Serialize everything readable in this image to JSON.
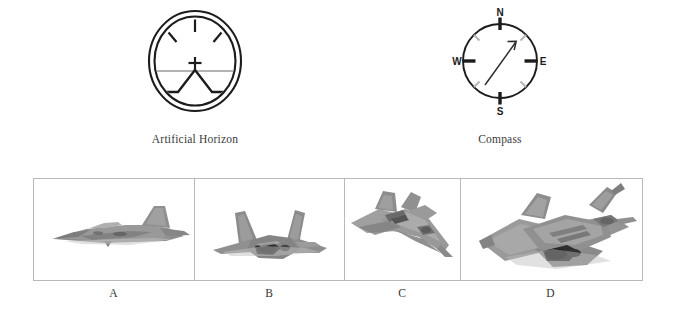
{
  "figure": {
    "background_color": "#ffffff",
    "frame_border_color": "#b9b9b9"
  },
  "instruments": [
    {
      "id": "artificial-horizon",
      "caption": "Artificial Horizon",
      "type": "attitude-indicator",
      "stroke_color": "#1c1c1c",
      "horizon_line_color": "#9a9a9a",
      "tick_marks": [
        "top-center",
        "upper-left-45",
        "upper-right-45"
      ],
      "crosshair": "+",
      "pitch_indicator": "peak-with-level-wings"
    },
    {
      "id": "compass",
      "caption": "Compass",
      "type": "heading-indicator",
      "stroke_color": "#1c1c1c",
      "cardinal_labels": [
        "N",
        "E",
        "S",
        "W"
      ],
      "minor_tick_color": "#b0b0b0",
      "needle_heading_deg": 27,
      "needle_label": "heading-arrow"
    }
  ],
  "panels": {
    "frame_label": "aircraft-view-strip",
    "items": [
      {
        "letter": "A",
        "view": "side-profile",
        "subject": "stealth fighter aircraft",
        "body_color": "#8e8e8e",
        "shadow_color": "#4f4f4f"
      },
      {
        "letter": "B",
        "view": "rear-underside",
        "subject": "stealth fighter aircraft",
        "body_color": "#8a8a8a",
        "shadow_color": "#3d3d3d"
      },
      {
        "letter": "C",
        "view": "three-quarter-top-front",
        "subject": "stealth fighter aircraft",
        "body_color": "#9a9a9a",
        "shadow_color": "#5a5a5a"
      },
      {
        "letter": "D",
        "view": "three-quarter-top-rear",
        "subject": "stealth fighter aircraft",
        "body_color": "#8d8d8d",
        "shadow_color": "#3a3a3a"
      }
    ]
  }
}
